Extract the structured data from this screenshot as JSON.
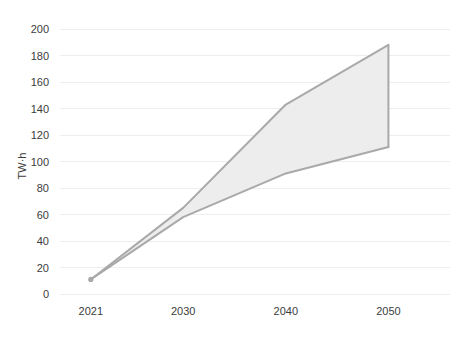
{
  "chart_data": {
    "type": "area",
    "title": "",
    "subtitle": "",
    "xlabel": "",
    "ylabel": "TW·h",
    "x": [
      2021,
      2030,
      2040,
      2050
    ],
    "categories": [
      "2021",
      "2030",
      "2040",
      "2050"
    ],
    "xtick_labels": [
      "2021",
      "2030",
      "2040",
      "2050"
    ],
    "ytick_labels": [
      "0",
      "20",
      "40",
      "60",
      "80",
      "100",
      "120",
      "140",
      "160",
      "180",
      "200"
    ],
    "ytick_values": [
      0,
      20,
      40,
      60,
      80,
      100,
      120,
      140,
      160,
      180,
      200
    ],
    "xlim": [
      2018,
      2056
    ],
    "ylim": [
      0,
      200
    ],
    "grid": true,
    "grid_axis": "y",
    "legend": false,
    "legend_position": "none",
    "series": [
      {
        "name": "Upper bound",
        "values": [
          11,
          65,
          143,
          188
        ]
      },
      {
        "name": "Lower bound",
        "values": [
          11,
          58,
          91,
          111
        ]
      }
    ],
    "band": {
      "upper": [
        11,
        65,
        143,
        188
      ],
      "lower": [
        11,
        58,
        91,
        111
      ]
    },
    "colors": {
      "band_fill": "#ededed",
      "band_border": "#a9a9a9",
      "gridline": "#eeeef1",
      "tick_text": "#3c3c3c",
      "background": "#ffffff"
    },
    "annotations": []
  },
  "plot": {
    "left": 60,
    "right": 450,
    "top": 29,
    "bottom": 294
  }
}
